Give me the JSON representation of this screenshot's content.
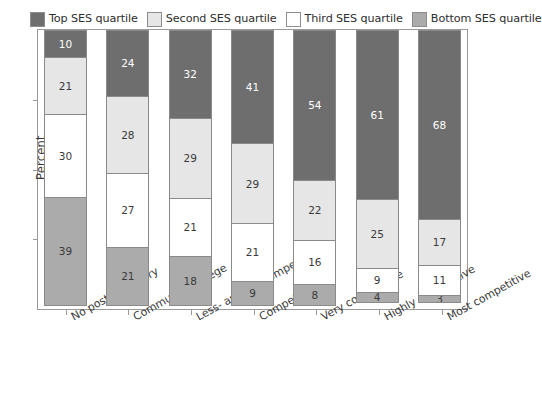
{
  "chart_data": {
    "type": "bar",
    "stacked": true,
    "title": "",
    "xlabel": "",
    "ylabel": "Percent",
    "ylim": [
      0,
      100
    ],
    "grid": false,
    "legend_position": "top",
    "categories": [
      "No postsecondary",
      "Community college",
      "Less- and noncompetitive",
      "Competitive",
      "Very competitive",
      "Highly competitive",
      "Most competitive"
    ],
    "series": [
      {
        "name": "Top SES quartile",
        "color": "#6e6e6e",
        "text_color": "#ffffff",
        "values": [
          10,
          24,
          32,
          41,
          54,
          61,
          68
        ]
      },
      {
        "name": "Second SES quartile",
        "color": "#e6e6e6",
        "text_color": "#3a3a3a",
        "values": [
          21,
          28,
          29,
          29,
          22,
          25,
          17
        ]
      },
      {
        "name": "Third SES quartile",
        "color": "#ffffff",
        "text_color": "#3a3a3a",
        "values": [
          30,
          27,
          21,
          21,
          16,
          9,
          11
        ]
      },
      {
        "name": "Bottom SES quartile",
        "color": "#ababab",
        "text_color": "#3a3a3a",
        "values": [
          39,
          21,
          18,
          9,
          8,
          4,
          3
        ]
      }
    ],
    "y_ticks": [
      0,
      25,
      50,
      75,
      100
    ],
    "y_tick_labels": [
      "",
      "",
      "",
      "",
      ""
    ]
  },
  "legend": {
    "items": [
      {
        "label": "Top SES quartile",
        "color": "#6e6e6e"
      },
      {
        "label": "Second SES quartile",
        "color": "#e6e6e6"
      },
      {
        "label": "Third SES quartile",
        "color": "#ffffff"
      },
      {
        "label": "Bottom SES quartile",
        "color": "#ababab"
      }
    ]
  },
  "axis": {
    "y_title": "Percent"
  }
}
